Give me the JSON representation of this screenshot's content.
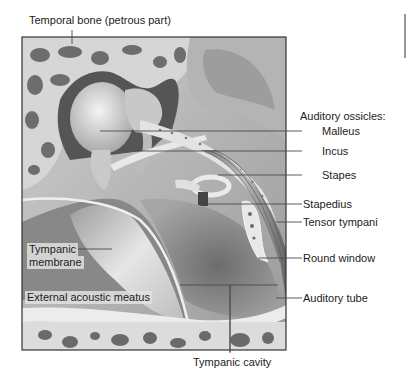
{
  "figure": {
    "labels": {
      "temporal_bone": "Temporal bone (petrous part)",
      "ossicles_heading": "Auditory ossicles:",
      "malleus": "Malleus",
      "incus": "Incus",
      "stapes": "Stapes",
      "stapedius": "Stapedius",
      "tensor_tympani": "Tensor tympani",
      "round_window": "Round window",
      "auditory_tube": "Auditory tube",
      "tympanic_membrane_line1": "Tympanic",
      "tympanic_membrane_line2": "membrane",
      "external_acoustic_meatus": "External acoustic meatus",
      "tympanic_cavity": "Tympanic cavity"
    },
    "colors": {
      "bone_light": "#d9d9d9",
      "bone_dark": "#5a5a5a",
      "cavity": "#8c8c8c",
      "frame": "#333333",
      "leader": "#4a4a4a"
    }
  }
}
